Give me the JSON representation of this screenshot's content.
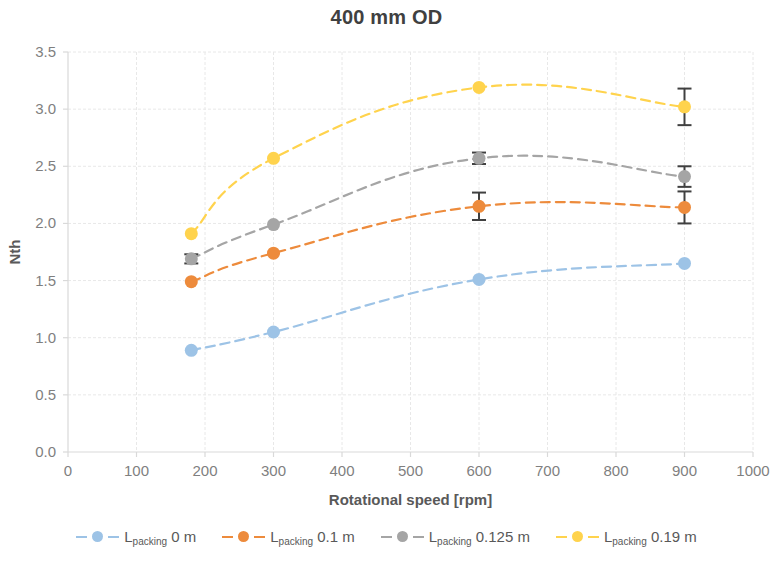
{
  "chart_data": {
    "type": "line",
    "title": "400 mm OD",
    "xlabel": "Rotational speed [rpm]",
    "ylabel": "Nth",
    "xlim": [
      0,
      1000
    ],
    "ylim": [
      0,
      3.5
    ],
    "xticks": [
      0,
      100,
      200,
      300,
      400,
      500,
      600,
      700,
      800,
      900,
      1000
    ],
    "yticks": [
      0.0,
      0.5,
      1.0,
      1.5,
      2.0,
      2.5,
      3.0,
      3.5
    ],
    "xtick_labels": [
      "0",
      "100",
      "200",
      "300",
      "400",
      "500",
      "600",
      "700",
      "800",
      "900",
      "1000"
    ],
    "ytick_labels": [
      "0.0",
      "0.5",
      "1.0",
      "1.5",
      "2.0",
      "2.5",
      "3.0",
      "3.5"
    ],
    "grid": true,
    "grid_axis": "both",
    "legend_position": "bottom",
    "line_style": "dashed",
    "smoothing": true,
    "series": [
      {
        "name": "L_packing 0 m",
        "label_base": "L",
        "label_sub": "packing",
        "label_value": "0 m",
        "color": "#9DC3E6",
        "x": [
          180,
          300,
          600,
          900
        ],
        "values": [
          0.89,
          1.05,
          1.51,
          1.65
        ],
        "errors": [
          0.0,
          0.0,
          0.0,
          0.0
        ]
      },
      {
        "name": "L_packing 0.1 m",
        "label_base": "L",
        "label_sub": "packing",
        "label_value": "0.1 m",
        "color": "#ED8B3C",
        "x": [
          180,
          300,
          600,
          900
        ],
        "values": [
          1.49,
          1.74,
          2.15,
          2.14
        ],
        "errors": [
          0.0,
          0.0,
          0.12,
          0.14
        ]
      },
      {
        "name": "L_packing 0.125 m",
        "label_base": "L",
        "label_sub": "packing",
        "label_value": "0.125 m",
        "color": "#A5A5A5",
        "x": [
          180,
          300,
          600,
          900
        ],
        "values": [
          1.69,
          1.99,
          2.57,
          2.41
        ],
        "errors": [
          0.04,
          0.0,
          0.05,
          0.09
        ]
      },
      {
        "name": "L_packing 0.19 m",
        "label_base": "L",
        "label_sub": "packing",
        "label_value": "0.19 m",
        "color": "#FFD34D",
        "x": [
          180,
          300,
          600,
          900
        ],
        "values": [
          1.91,
          2.57,
          3.19,
          3.02
        ],
        "errors": [
          0.0,
          0.0,
          0.0,
          0.16
        ]
      }
    ]
  },
  "layout": {
    "plot_left": 68,
    "plot_right": 753,
    "plot_top": 52,
    "plot_bottom": 452,
    "axis_color": "#D9D9D9",
    "grid_color": "#E8E8E8",
    "text_color": "#7f7f7f"
  },
  "legend": {
    "items": [
      {
        "label_base": "L",
        "label_sub": "packing",
        "label_value": "0 m",
        "color": "#9DC3E6"
      },
      {
        "label_base": "L",
        "label_sub": "packing",
        "label_value": "0.1 m",
        "color": "#ED8B3C"
      },
      {
        "label_base": "L",
        "label_sub": "packing",
        "label_value": "0.125 m",
        "color": "#A5A5A5"
      },
      {
        "label_base": "L",
        "label_sub": "packing",
        "label_value": "0.19 m",
        "color": "#FFD34D"
      }
    ]
  }
}
